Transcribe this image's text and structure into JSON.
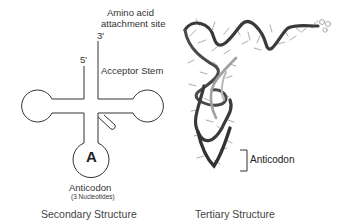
{
  "secondary": {
    "amino_acid_line1": "Amino acid",
    "amino_acid_line2": "attachment site",
    "three_prime": "3'",
    "five_prime": "5'",
    "acceptor_stem": "Acceptor Stem",
    "anticodon_letter": "A",
    "anticodon_label": "Anticodon",
    "anticodon_sub": "(3 Nucleotides)",
    "caption": "Secondary Structure"
  },
  "tertiary": {
    "anticodon_label": "Anticodon",
    "caption": "Tertiary Structure"
  },
  "colors": {
    "line": "#333333",
    "ribbon_dark": "#3a3a3a",
    "ribbon_light": "#9a9a9a",
    "bases": "#777777"
  }
}
